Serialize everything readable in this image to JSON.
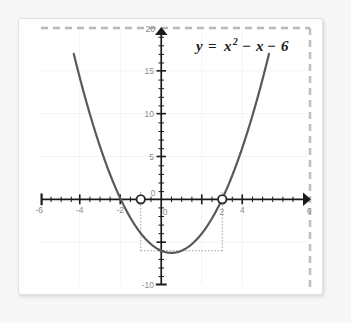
{
  "figure": {
    "background_color": "#ffffff",
    "page_background_color": "#f7f7f7",
    "border_color": "#e2e2e2"
  },
  "equation": {
    "label_full": "y = x2 - x - 6",
    "lhs": "y",
    "equals": "=",
    "term_base": "x",
    "term_exponent": "2",
    "minus_one": "−",
    "term_linear": "x",
    "minus_two": "−",
    "constant": "6"
  },
  "chart_data": {
    "type": "line",
    "xlabel": "",
    "ylabel": "",
    "xlim": [
      -6,
      6
    ],
    "ylim": [
      -10,
      20
    ],
    "grid": true,
    "grid_color": "#f2f2f2",
    "curve_color": "#595959",
    "axis_color": "#1b1b1b",
    "function": "y = x^2 - x - 6",
    "x_tick_labels": [
      "-6",
      "-4",
      "-2",
      "0",
      "2",
      "4",
      "6"
    ],
    "x_tick_values": [
      -6,
      -4,
      -2,
      0,
      2,
      4,
      6
    ],
    "x_minor_tick_step": 0.5,
    "y_tick_labels": [
      "20",
      "15",
      "10",
      "5",
      "0",
      "-10"
    ],
    "y_tick_values": [
      20,
      15,
      10,
      5,
      0,
      -10
    ],
    "y_minor_tick_step": 1,
    "x": [
      -4.32,
      -4.0,
      -3.5,
      -3.0,
      -2.5,
      -2.0,
      -1.5,
      -1.0,
      -0.5,
      0.0,
      0.5,
      1.0,
      1.5,
      2.0,
      2.5,
      3.0,
      3.5,
      4.0,
      4.5,
      5.0,
      5.32
    ],
    "y": [
      16.98,
      14.0,
      9.75,
      6.0,
      2.75,
      0.0,
      -2.25,
      -4.0,
      -5.25,
      -6.0,
      -6.25,
      -6.0,
      -5.25,
      -4.0,
      -2.25,
      0.0,
      2.75,
      6.0,
      9.75,
      14.0,
      16.98
    ],
    "vertex": {
      "x": 0.5,
      "y": -6.25
    },
    "annotations": {
      "open_points": [
        {
          "label": "root-left",
          "x": -1,
          "y": 0,
          "style": "open-circle"
        },
        {
          "label": "root-right",
          "x": 2,
          "y": 0,
          "style": "open-circle"
        }
      ],
      "dotted_guides": [
        {
          "type": "vertical",
          "x": -1,
          "y_from": 0.8,
          "y_to": -6
        },
        {
          "type": "vertical",
          "x": 2,
          "y_from": 0.8,
          "y_to": -6
        },
        {
          "type": "horizontal",
          "y": -6,
          "x_from": -1,
          "x_to": 2
        }
      ],
      "dashed_bounds": [
        {
          "type": "horizontal",
          "y": 20,
          "color": "#b8b8b8"
        },
        {
          "type": "vertical",
          "x": 6,
          "color": "#b8b8b8"
        }
      ]
    }
  }
}
